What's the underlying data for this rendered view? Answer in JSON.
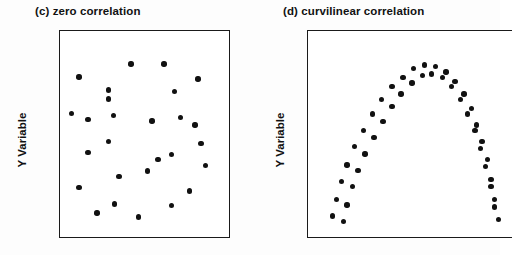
{
  "figure": {
    "background_color": "#ffffff",
    "ink_color": "#111111",
    "panels": [
      {
        "id": "c",
        "title": "(c) zero correlation",
        "ylabel": "Y Variable",
        "box": {
          "x": 59,
          "y": 30,
          "width": 171,
          "height": 208,
          "border_color": "#1a1a1a",
          "fill": "#ffffff",
          "right_border": true
        }
      },
      {
        "id": "d",
        "title": "(d) curvilinear correlation",
        "ylabel": "Y Variable",
        "box": {
          "x": 307,
          "y": 30,
          "width": 205,
          "height": 208,
          "border_color": "#1a1a1a",
          "fill": "#ffffff",
          "right_border": false
        }
      }
    ]
  },
  "chart_data": [
    {
      "type": "scatter",
      "title": "(c) zero correlation",
      "xlabel": "",
      "ylabel": "Y Variable",
      "xlim": [
        0,
        100
      ],
      "ylim": [
        0,
        100
      ],
      "grid": false,
      "legend": "none",
      "marker": {
        "shape": "circle",
        "color": "#111111",
        "size_px": 5.4
      },
      "n_points": 27,
      "points": [
        [
          41,
          88
        ],
        [
          63,
          88
        ],
        [
          6,
          81
        ],
        [
          86,
          80
        ],
        [
          26,
          74
        ],
        [
          70,
          73
        ],
        [
          1,
          61
        ],
        [
          29,
          60
        ],
        [
          74,
          59
        ],
        [
          55,
          57
        ],
        [
          84,
          55
        ],
        [
          26,
          46
        ],
        [
          12,
          40
        ],
        [
          68,
          39
        ],
        [
          59,
          36
        ],
        [
          91,
          33
        ],
        [
          52,
          30
        ],
        [
          33,
          27
        ],
        [
          6,
          21
        ],
        [
          80,
          19
        ],
        [
          30,
          12
        ],
        [
          68,
          11
        ],
        [
          18,
          7
        ],
        [
          26,
          69
        ],
        [
          88,
          45
        ],
        [
          12,
          58
        ],
        [
          46,
          5
        ]
      ]
    },
    {
      "type": "scatter",
      "title": "(d) curvilinear correlation",
      "xlabel": "",
      "ylabel": "Y Variable",
      "xlim": [
        0,
        100
      ],
      "ylim": [
        0,
        100
      ],
      "grid": false,
      "legend": "none",
      "marker": {
        "shape": "circle",
        "color": "#111111",
        "size_px": 5.4
      },
      "n_points": 44,
      "description": "Two near-parallel arcs forming an inverted-U (parabola) shape",
      "series": [
        {
          "name": "upper arc",
          "points": [
            [
              7,
              5
            ],
            [
              9,
              14
            ],
            [
              12,
              24
            ],
            [
              15,
              33
            ],
            [
              19,
              43
            ],
            [
              24,
              52
            ],
            [
              29,
              61
            ],
            [
              34,
              69
            ],
            [
              40,
              76
            ],
            [
              46,
              81
            ],
            [
              52,
              86
            ],
            [
              58,
              88
            ],
            [
              64,
              87
            ],
            [
              70,
              84
            ],
            [
              75,
              79
            ],
            [
              80,
              72
            ],
            [
              84,
              64
            ],
            [
              87,
              55
            ],
            [
              90,
              46
            ],
            [
              93,
              36
            ],
            [
              95,
              25
            ],
            [
              97,
              14
            ]
          ]
        },
        {
          "name": "lower arc",
          "points": [
            [
              13,
              2
            ],
            [
              15,
              11
            ],
            [
              18,
              21
            ],
            [
              21,
              30
            ],
            [
              25,
              39
            ],
            [
              30,
              48
            ],
            [
              35,
              57
            ],
            [
              40,
              65
            ],
            [
              45,
              72
            ],
            [
              51,
              78
            ],
            [
              57,
              82
            ],
            [
              62,
              83
            ],
            [
              68,
              81
            ],
            [
              73,
              76
            ],
            [
              78,
              69
            ],
            [
              82,
              61
            ],
            [
              86,
              52
            ],
            [
              89,
              42
            ],
            [
              92,
              32
            ],
            [
              95,
              21
            ],
            [
              97,
              10
            ],
            [
              99,
              3
            ]
          ]
        }
      ]
    }
  ]
}
